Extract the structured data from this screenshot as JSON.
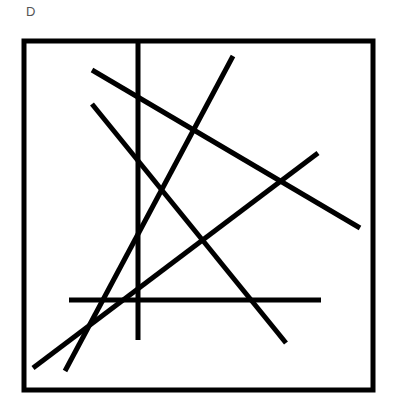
{
  "figure": {
    "label": "D",
    "stroke_color": "#000000",
    "background": "#ffffff",
    "frame": {
      "x": 24,
      "y": 41,
      "width": 349,
      "height": 349,
      "stroke_width": 5
    },
    "line_width": 5,
    "lines": [
      {
        "x1": 138,
        "y1": 41,
        "x2": 138,
        "y2": 340
      },
      {
        "x1": 92,
        "y1": 70,
        "x2": 360,
        "y2": 228
      },
      {
        "x1": 92,
        "y1": 104,
        "x2": 286,
        "y2": 343
      },
      {
        "x1": 233,
        "y1": 56,
        "x2": 65,
        "y2": 371
      },
      {
        "x1": 318,
        "y1": 153,
        "x2": 33,
        "y2": 368
      },
      {
        "x1": 69,
        "y1": 300,
        "x2": 321,
        "y2": 300
      }
    ]
  }
}
